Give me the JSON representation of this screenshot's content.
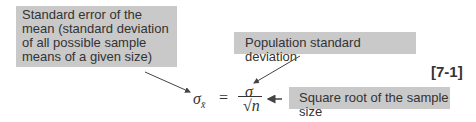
{
  "annotations": {
    "standard_error": "Standard error of the mean (standard deviation of all possible sample means of a given size)",
    "population_sd": "Population standard deviation",
    "sqrt_n": "Square root of the sample size"
  },
  "equation": {
    "lhs_symbol": "σ",
    "lhs_subscript": "x̄",
    "equals": "=",
    "numerator": "σ",
    "denominator_radical": "√",
    "denominator_var": "n",
    "number": "[7-1]"
  },
  "colors": {
    "box_fill": "#c9c9c9",
    "text": "#333333"
  }
}
